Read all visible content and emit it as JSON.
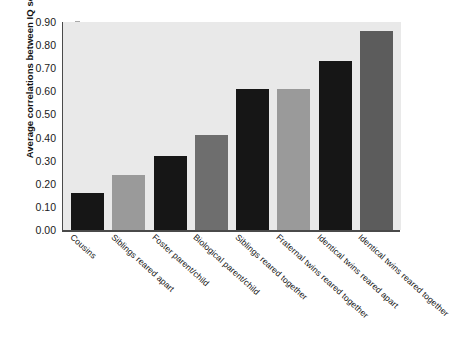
{
  "chart_data": {
    "type": "bar",
    "title": "",
    "xlabel": "",
    "ylabel": "Average correlations between IQ scores",
    "ylim": [
      0.0,
      0.9
    ],
    "ytick_labels": [
      "0.90",
      "0.80",
      "0.70",
      "0.60",
      "0.50",
      "0.40",
      "0.30",
      "0.20",
      "0.10",
      "0.00"
    ],
    "ytick_values": [
      0.9,
      0.8,
      0.7,
      0.6,
      0.5,
      0.4,
      0.3,
      0.2,
      0.1,
      0.0
    ],
    "grid": false,
    "legend": "none",
    "categories": [
      "Cousins",
      "Siblings reared apart",
      "Foster parent/child",
      "Biological parent/child",
      "Siblings reared together",
      "Fraternal twins reared together",
      "Identical twins reared apart",
      "Identical twins reared together"
    ],
    "values": [
      0.16,
      0.24,
      0.32,
      0.41,
      0.61,
      0.61,
      0.73,
      0.86
    ],
    "bar_colors": [
      "#161616",
      "#9a9a9a",
      "#161616",
      "#6e6e6e",
      "#161616",
      "#9a9a9a",
      "#161616",
      "#5c5c5c"
    ],
    "plot_background": "#e9e9e9",
    "axis_color": "#4a4a4a"
  }
}
